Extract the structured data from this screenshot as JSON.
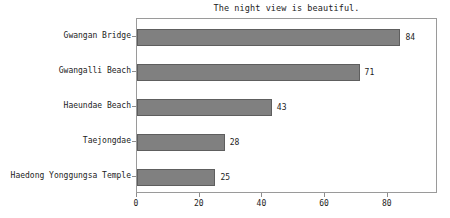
{
  "chart_data": {
    "type": "bar",
    "orientation": "horizontal",
    "title": "The night view is beautiful.",
    "xlabel": "",
    "ylabel": "",
    "categories": [
      "Gwangan Bridge",
      "Gwangalli Beach",
      "Haeundae Beach",
      "Taejongdae",
      "Haedong Yonggungsa Temple"
    ],
    "values": [
      84,
      71,
      43,
      28,
      25
    ],
    "value_labels": [
      "84",
      "71",
      "43",
      "28",
      "25"
    ],
    "xticks": [
      0,
      20,
      40,
      60,
      80
    ],
    "xtick_labels": [
      "0",
      "20",
      "40",
      "60",
      "80"
    ],
    "xlim": [
      0,
      96
    ],
    "grid": false,
    "legend": null,
    "colors": {
      "bar_fill": "#808080",
      "bar_edge": "#5e5e5e",
      "frame": "#9a9a9a",
      "text": "#1c1c1c",
      "background": "#ffffff"
    }
  }
}
